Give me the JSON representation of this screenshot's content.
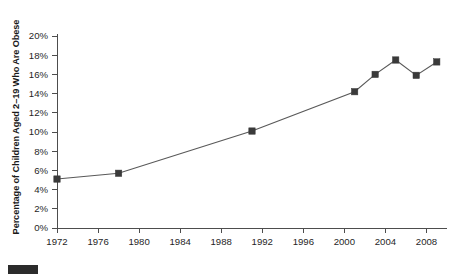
{
  "chart_data": {
    "type": "line",
    "title": "",
    "subtitle": "",
    "xlabel": "",
    "ylabel": "Percentage of Children Aged 2–19 Who Are Obese",
    "xlim": [
      1972,
      2010
    ],
    "ylim": [
      0,
      20
    ],
    "grid": false,
    "legend_position": "none",
    "x_tick_labels": [
      "1972",
      "1976",
      "1980",
      "1984",
      "1988",
      "1992",
      "1996",
      "2000",
      "2004",
      "2008"
    ],
    "x_ticks": [
      1972,
      1976,
      1980,
      1984,
      1988,
      1992,
      1996,
      2000,
      2004,
      2008
    ],
    "y_tick_labels": [
      "0%",
      "2%",
      "4%",
      "6%",
      "8%",
      "10%",
      "12%",
      "14%",
      "16%",
      "18%",
      "20%"
    ],
    "y_ticks": [
      0,
      2,
      4,
      6,
      8,
      10,
      12,
      14,
      16,
      18,
      20
    ],
    "series": [
      {
        "name": "Percentage of children aged 2-19 who are obese",
        "marker": "square",
        "marker_color": "#3a3a3a",
        "line_color": "#595959",
        "x": [
          1972,
          1978,
          1991,
          2001,
          2003,
          2005,
          2007,
          2009
        ],
        "values": [
          5.1,
          5.7,
          10.1,
          14.2,
          16.0,
          17.5,
          15.9,
          17.3
        ],
        "points": [
          {
            "x": 1972,
            "y": 5.1
          },
          {
            "x": 1978,
            "y": 5.7
          },
          {
            "x": 1991,
            "y": 10.1
          },
          {
            "x": 2001,
            "y": 14.2
          },
          {
            "x": 2003,
            "y": 16.0
          },
          {
            "x": 2005,
            "y": 17.5
          },
          {
            "x": 2007,
            "y": 15.9
          },
          {
            "x": 2009,
            "y": 17.3
          }
        ]
      }
    ],
    "annotations": []
  },
  "axis": {
    "y_title": "Percentage of Children Aged 2–19 Who Are Obese"
  },
  "caption": {
    "text": ""
  },
  "colors": {
    "line": "#595959",
    "marker": "#3a3a3a",
    "axis": "#4d4d4d",
    "text": "#1f1f1f",
    "swatch": "#2b2b2b",
    "background": "#ffffff"
  }
}
